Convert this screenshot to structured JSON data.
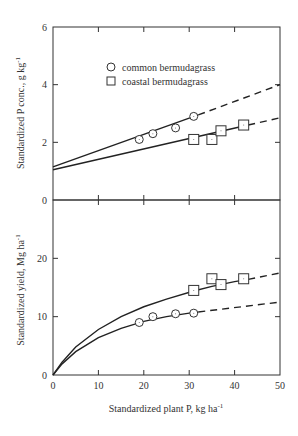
{
  "chart_data": [
    {
      "type": "line",
      "panel": "top",
      "title": "",
      "xlabel": "",
      "ylabel": "Standardized P conc., g kg",
      "ylabel_sup": "-1",
      "xlim": [
        0,
        50
      ],
      "ylim": [
        0,
        6
      ],
      "y_ticks": [
        "0",
        "2",
        "4",
        "6"
      ],
      "x_ticks": [
        0,
        10,
        20,
        30,
        40,
        50
      ],
      "grid": false,
      "legend": {
        "position": "upper-left-center",
        "entries": [
          {
            "marker": "circle",
            "label": "common bermudagrass"
          },
          {
            "marker": "square",
            "label": "coastal bermudagrass"
          }
        ]
      },
      "series": [
        {
          "name": "common bermudagrass",
          "marker": "circle",
          "points": [
            [
              19,
              2.1
            ],
            [
              22,
              2.3
            ],
            [
              27,
              2.5
            ],
            [
              31,
              2.9
            ]
          ],
          "fit_solid": [
            [
              0,
              1.15
            ],
            [
              32,
              2.95
            ]
          ],
          "fit_dashed": [
            [
              32,
              2.95
            ],
            [
              50,
              4.0
            ]
          ]
        },
        {
          "name": "coastal bermudagrass",
          "marker": "square",
          "points": [
            [
              31,
              2.1
            ],
            [
              35,
              2.1
            ],
            [
              37,
              2.4
            ],
            [
              42,
              2.6
            ]
          ],
          "fit_solid": [
            [
              0,
              1.05
            ],
            [
              43,
              2.6
            ]
          ],
          "fit_dashed": [
            [
              43,
              2.6
            ],
            [
              50,
              2.85
            ]
          ]
        }
      ]
    },
    {
      "type": "line",
      "panel": "bottom",
      "title": "",
      "xlabel": "Standardized plant P, kg ha",
      "xlabel_sup": "-1",
      "ylabel": "Standardized yield, Mg ha",
      "ylabel_sup": "-1",
      "xlim": [
        0,
        50
      ],
      "ylim": [
        0,
        30
      ],
      "y_ticks": [
        "0",
        "10",
        "20"
      ],
      "x_ticks": [
        "0",
        "10",
        "20",
        "30",
        "40",
        "50"
      ],
      "grid": false,
      "series": [
        {
          "name": "coastal bermudagrass",
          "marker": "square",
          "points": [
            [
              31,
              14.5
            ],
            [
              35,
              16.5
            ],
            [
              37,
              15.5
            ],
            [
              42,
              16.5
            ]
          ],
          "fit_solid": [
            [
              0,
              0
            ],
            [
              2,
              2.2
            ],
            [
              5,
              4.8
            ],
            [
              10,
              7.8
            ],
            [
              15,
              10.0
            ],
            [
              20,
              11.7
            ],
            [
              25,
              13.0
            ],
            [
              31,
              14.4
            ],
            [
              35,
              15.2
            ],
            [
              40,
              16.0
            ],
            [
              43,
              16.4
            ]
          ],
          "fit_dashed": [
            [
              43,
              16.4
            ],
            [
              50,
              17.5
            ]
          ]
        },
        {
          "name": "common bermudagrass",
          "marker": "circle",
          "points": [
            [
              19,
              9.0
            ],
            [
              22,
              10.0
            ],
            [
              27,
              10.5
            ],
            [
              31,
              10.6
            ]
          ],
          "fit_solid": [
            [
              0,
              0
            ],
            [
              2,
              1.9
            ],
            [
              5,
              4.0
            ],
            [
              10,
              6.4
            ],
            [
              15,
              8.0
            ],
            [
              20,
              9.2
            ],
            [
              25,
              10.0
            ],
            [
              30,
              10.6
            ],
            [
              32,
              10.8
            ]
          ],
          "fit_dashed": [
            [
              32,
              10.8
            ],
            [
              50,
              12.5
            ]
          ]
        }
      ]
    }
  ]
}
